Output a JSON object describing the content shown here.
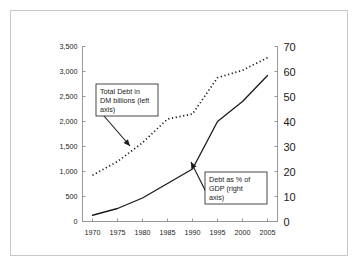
{
  "figure": {
    "frame_color": "#c8c8c8",
    "background": "#ffffff",
    "ink_color": "#1a1a1a",
    "axis_color": "#8c8c8c"
  },
  "chart_data": {
    "type": "line",
    "title": "",
    "subtitle": "",
    "xlabel": "",
    "grid": false,
    "legend_position": "annotations-inline",
    "x": [
      1970,
      1975,
      1980,
      1985,
      1990,
      1995,
      2000,
      2005
    ],
    "xlim": [
      1968,
      2007
    ],
    "x_tick_labels": [
      "1970",
      "1975",
      "1980",
      "1985",
      "1990",
      "1995",
      "2000",
      "2005"
    ],
    "axes": [
      {
        "id": "left",
        "label": "Total Debt in DM billions",
        "ylim": [
          0,
          3500
        ],
        "ytick_step": 500,
        "tick_labels": [
          "0",
          "500",
          "1,000",
          "1,500",
          "2,000",
          "2,500",
          "3,000",
          "3,500"
        ],
        "tick_values": [
          0,
          500,
          1000,
          1500,
          2000,
          2500,
          3000,
          3500
        ]
      },
      {
        "id": "right",
        "label": "Debt as % of GDP",
        "ylim": [
          0,
          70
        ],
        "ytick_step": 10,
        "tick_labels": [
          "0",
          "10",
          "20",
          "30",
          "40",
          "50",
          "60",
          "70"
        ],
        "tick_values": [
          0,
          10,
          20,
          30,
          40,
          50,
          60,
          70
        ]
      }
    ],
    "series": [
      {
        "name": "Total Debt in DM billions (left axis)",
        "axis": "left",
        "style": "solid",
        "x": [
          1970,
          1975,
          1980,
          1985,
          1990,
          1995,
          2000,
          2005
        ],
        "values": [
          125,
          260,
          470,
          760,
          1050,
          2000,
          2400,
          2920
        ]
      },
      {
        "name": "Debt as % of GDP (right axis)",
        "axis": "right",
        "style": "dotted",
        "x": [
          1970,
          1975,
          1980,
          1985,
          1990,
          1995,
          2000,
          2005
        ],
        "values": [
          18.5,
          24,
          31.5,
          41,
          43,
          57.5,
          60.5,
          65.5
        ]
      }
    ],
    "annotations": [
      {
        "id": "callout-left-series",
        "lines": [
          "Total Debt in",
          "DM billions (left",
          "axis)"
        ],
        "box": {
          "x": 96,
          "y": 84,
          "width": 62,
          "height": 32
        },
        "arrow": {
          "x1": 104,
          "y1": 116,
          "x2": 130,
          "y2": 146
        }
      },
      {
        "id": "callout-right-series",
        "lines": [
          "Debt as % of",
          "GDP (right",
          "axis)"
        ],
        "box": {
          "x": 205,
          "y": 172,
          "width": 62,
          "height": 32
        },
        "arrow": {
          "x1": 212,
          "y1": 204,
          "x2": 191,
          "y2": 162
        }
      }
    ]
  }
}
